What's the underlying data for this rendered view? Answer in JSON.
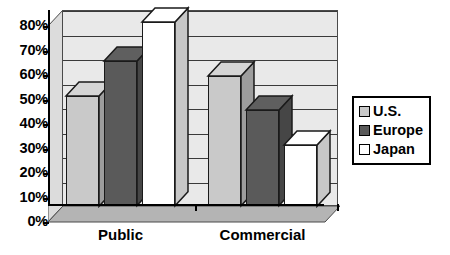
{
  "chart_data": {
    "type": "bar",
    "title": "",
    "subtitle": "",
    "xlabel": "",
    "ylabel": "",
    "categories": [
      "Public",
      "Commercial"
    ],
    "series": [
      {
        "name": "U.S.",
        "values": [
          45,
          53
        ],
        "color": "#c9c9c9"
      },
      {
        "name": "Europe",
        "values": [
          59,
          39
        ],
        "color": "#5a5a5a"
      },
      {
        "name": "Japan",
        "values": [
          75,
          25
        ],
        "color": "#ffffff"
      }
    ],
    "ylim": [
      0,
      80
    ],
    "y_tick_values": [
      0,
      10,
      20,
      30,
      40,
      50,
      60,
      70,
      80
    ],
    "y_tick_labels": [
      "0%",
      "10%",
      "20%",
      "30%",
      "40%",
      "50%",
      "60%",
      "70%",
      "80%"
    ],
    "grid": true,
    "grid_axis": "y",
    "legend_position": "right",
    "style": "3d-column",
    "plot_background": "#e9e9e9",
    "grid_color": "#3a3a3a",
    "axis_color": "#000000",
    "bar_outline_color": "#1a1a1a"
  },
  "legend": {
    "entries": [
      {
        "label": "U.S.",
        "swatch": "#c9c9c9"
      },
      {
        "label": "Europe",
        "swatch": "#5a5a5a"
      },
      {
        "label": "Japan",
        "swatch": "#ffffff"
      }
    ]
  }
}
